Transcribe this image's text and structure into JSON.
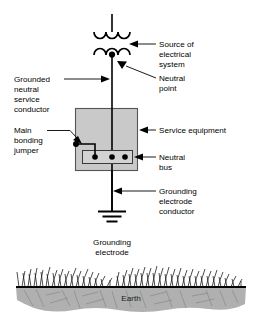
{
  "diagram": {
    "colors": {
      "line": "#000000",
      "equipment_fill": "#c9c9c9",
      "equipment_stroke": "#555555",
      "bus_fill": "#d3d3d3",
      "soil_fill": "#b0b0b0",
      "background": "#ffffff"
    },
    "labels": {
      "source_of_electrical_system": [
        "Source of",
        "electrical",
        "system"
      ],
      "neutral_point": [
        "Neutral",
        "point"
      ],
      "grounded_neutral_service_conductor": [
        "Grounded",
        "neutral",
        "service",
        "conductor"
      ],
      "main_bonding_jumper": [
        "Main",
        "bonding",
        "jumper"
      ],
      "service_equipment": [
        "Service equipment"
      ],
      "neutral_bus": [
        "Neutral",
        "bus"
      ],
      "grounding_electrode_conductor": [
        "Grounding",
        "electrode",
        "conductor"
      ],
      "grounding_electrode": [
        "Grounding",
        "electrode"
      ],
      "earth": "Earth"
    },
    "components": {
      "transformer_primary_winding": "3-hump coil (arcs opening down)",
      "transformer_secondary_winding": "3-hump coil (arcs opening up)",
      "neutral_bus_terminals": 3,
      "grounding_electrode_symbol": "3 stacked horizontal bars"
    }
  }
}
